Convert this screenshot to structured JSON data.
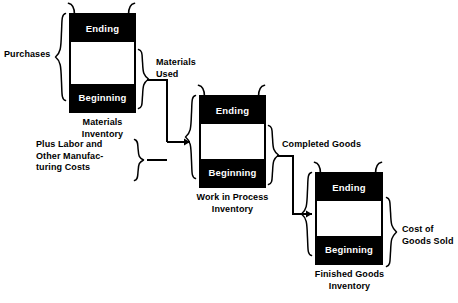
{
  "diagram": {
    "boxes": [
      {
        "id": "materials",
        "ending_label": "Ending",
        "beginning_label": "Beginning",
        "caption_line1": "Materials",
        "caption_line2": "Inventory"
      },
      {
        "id": "work-in-process",
        "ending_label": "Ending",
        "beginning_label": "Beginning",
        "caption_line1": "Work in Process",
        "caption_line2": "Inventory"
      },
      {
        "id": "finished-goods",
        "ending_label": "Ending",
        "beginning_label": "Beginning",
        "caption_line1": "Finished Goods",
        "caption_line2": "Inventory"
      }
    ],
    "labels": {
      "purchases": "Purchases",
      "materials_used_line1": "Materials",
      "materials_used_line2": "Used",
      "plus_labor_line1": "Plus Labor and",
      "plus_labor_line2": "Other Manufac-",
      "plus_labor_line3": "turing Costs",
      "completed_goods": "Completed Goods",
      "cost_of_goods_sold_line1": "Cost of",
      "cost_of_goods_sold_line2": "Goods Sold"
    },
    "colors": {
      "ink": "#000000",
      "paper": "#ffffff",
      "band_text": "#ffffff"
    }
  }
}
